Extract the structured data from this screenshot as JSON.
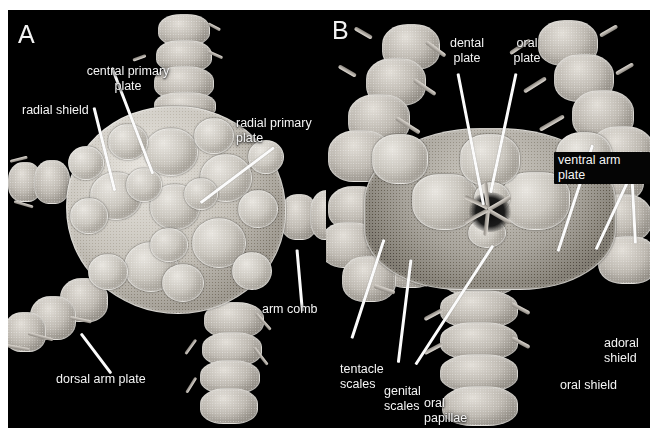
{
  "figure": {
    "type": "scanning-electron-micrograph",
    "background_color": "#000000",
    "label_color": "#f4f4f4",
    "leader_line_color": "#fbfbfb",
    "page_background": "#ffffff"
  },
  "panels": [
    {
      "id": "A",
      "letter": "A",
      "view": "dorsal (aboral) surface of disc",
      "labels": [
        {
          "name": "central-primary-plate",
          "text": "central primary\nplate"
        },
        {
          "name": "radial-shield",
          "text": "radial shield"
        },
        {
          "name": "radial-primary-plate",
          "text": "radial primary\nplate"
        },
        {
          "name": "arm-comb",
          "text": "arm comb"
        },
        {
          "name": "dorsal-arm-plate",
          "text": "dorsal arm plate"
        }
      ]
    },
    {
      "id": "B",
      "letter": "B",
      "view": "ventral (oral) surface of disc",
      "labels": [
        {
          "name": "dental-plate",
          "text": "dental\nplate"
        },
        {
          "name": "oral-plate",
          "text": "oral\nplate"
        },
        {
          "name": "ventral-arm-plate",
          "text": "ventral arm plate"
        },
        {
          "name": "tentacle-scales",
          "text": "tentacle\nscales"
        },
        {
          "name": "genital-scales",
          "text": "genital\nscales"
        },
        {
          "name": "oral-papillae",
          "text": "oral\npapillae"
        },
        {
          "name": "oral-shield",
          "text": "oral shield"
        },
        {
          "name": "adoral-shield",
          "text": "adoral\nshield"
        }
      ]
    }
  ]
}
